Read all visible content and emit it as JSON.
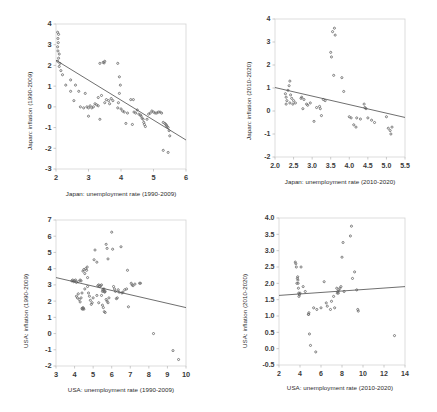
{
  "figure": {
    "type": "scatter-grid",
    "panel_count": 4,
    "marker_color": "#6b6b6b",
    "trendline_color": "#4a4a4a",
    "axis_color": "#d0d0d0",
    "background": "#ffffff"
  },
  "chart_data": [
    {
      "id": "japan-1990-2009",
      "type": "scatter",
      "title": "",
      "xlabel": "Japan: unemployment rate (1990-2009)",
      "ylabel": "Japan: inflation (1990-2009)",
      "xlim": [
        2,
        6
      ],
      "ylim": [
        -3,
        4
      ],
      "xticks": [
        "2",
        "3",
        "4",
        "5",
        "6"
      ],
      "yticks": [
        "-3",
        "-2",
        "-1",
        "0",
        "1",
        "2",
        "3",
        "4"
      ],
      "grid": false,
      "legend": "none",
      "trendline": {
        "x0": 2.0,
        "y0": 2.25,
        "x1": 6.0,
        "y1": -1.6
      },
      "points": [
        [
          2.05,
          3.6
        ],
        [
          2.08,
          3.5
        ],
        [
          2.06,
          3.3
        ],
        [
          2.07,
          3.1
        ],
        [
          2.05,
          2.9
        ],
        [
          2.06,
          2.7
        ],
        [
          2.1,
          2.55
        ],
        [
          2.08,
          2.35
        ],
        [
          2.05,
          2.2
        ],
        [
          2.12,
          2.1
        ],
        [
          2.1,
          1.95
        ],
        [
          2.15,
          1.75
        ],
        [
          2.2,
          1.55
        ],
        [
          2.3,
          1.05
        ],
        [
          2.45,
          1.3
        ],
        [
          2.6,
          1.05
        ],
        [
          2.45,
          0.75
        ],
        [
          2.7,
          0.75
        ],
        [
          2.9,
          0.65
        ],
        [
          2.55,
          0.3
        ],
        [
          2.95,
          0.0
        ],
        [
          3.0,
          -0.05
        ],
        [
          3.05,
          0.05
        ],
        [
          3.1,
          -0.05
        ],
        [
          3.15,
          0.0
        ],
        [
          3.2,
          0.15
        ],
        [
          3.25,
          0.1
        ],
        [
          3.3,
          0.05
        ],
        [
          3.35,
          2.1
        ],
        [
          3.45,
          2.15
        ],
        [
          3.5,
          2.2
        ],
        [
          3.48,
          2.12
        ],
        [
          3.3,
          0.45
        ],
        [
          3.35,
          -0.6
        ],
        [
          3.4,
          0.55
        ],
        [
          3.5,
          0.2
        ],
        [
          3.55,
          0.35
        ],
        [
          3.62,
          0.3
        ],
        [
          3.65,
          0.15
        ],
        [
          3.7,
          0.4
        ],
        [
          3.75,
          0.3
        ],
        [
          3.9,
          2.1
        ],
        [
          3.95,
          1.45
        ],
        [
          3.98,
          1.05
        ],
        [
          3.95,
          0.65
        ],
        [
          3.92,
          0.2
        ],
        [
          4.0,
          -0.1
        ],
        [
          4.05,
          -0.2
        ],
        [
          4.1,
          -0.25
        ],
        [
          4.2,
          -0.3
        ],
        [
          4.3,
          0.35
        ],
        [
          4.38,
          0.35
        ],
        [
          4.4,
          -0.25
        ],
        [
          4.45,
          -0.3
        ],
        [
          4.5,
          -0.15
        ],
        [
          4.55,
          -0.35
        ],
        [
          4.6,
          -0.4
        ],
        [
          4.62,
          -0.45
        ],
        [
          4.65,
          -0.55
        ],
        [
          4.68,
          -0.6
        ],
        [
          4.7,
          -0.75
        ],
        [
          4.72,
          -0.85
        ],
        [
          4.75,
          -0.95
        ],
        [
          4.8,
          -0.6
        ],
        [
          4.85,
          -0.35
        ],
        [
          4.9,
          -0.3
        ],
        [
          4.95,
          -0.2
        ],
        [
          5.0,
          -0.25
        ],
        [
          5.05,
          -0.3
        ],
        [
          5.1,
          -0.3
        ],
        [
          5.15,
          -0.25
        ],
        [
          5.2,
          -0.25
        ],
        [
          5.25,
          -0.3
        ],
        [
          5.3,
          -0.75
        ],
        [
          5.35,
          -0.8
        ],
        [
          5.38,
          -0.85
        ],
        [
          5.4,
          -0.9
        ],
        [
          5.42,
          -0.95
        ],
        [
          5.45,
          -1.0
        ],
        [
          5.48,
          -1.15
        ],
        [
          5.3,
          -2.1
        ],
        [
          5.45,
          -2.2
        ],
        [
          5.5,
          -1.4
        ],
        [
          4.35,
          -0.85
        ],
        [
          4.15,
          -0.8
        ],
        [
          3.9,
          -0.05
        ],
        [
          2.75,
          0.0
        ],
        [
          2.85,
          -0.05
        ],
        [
          3.0,
          -0.45
        ]
      ]
    },
    {
      "id": "japan-2010-2020",
      "type": "scatter",
      "title": "",
      "xlabel": "Japan: unemployment rate (2010-2020)",
      "ylabel": "Japan: inflation (2010-2020)",
      "xlim": [
        2.0,
        5.5
      ],
      "ylim": [
        -2,
        4
      ],
      "xticks": [
        "2.0",
        "2.5",
        "3.0",
        "3.5",
        "4.0",
        "4.5",
        "5.0",
        "5.5"
      ],
      "yticks": [
        "-2",
        "-1",
        "0",
        "1",
        "2",
        "3",
        "4"
      ],
      "grid": false,
      "legend": "none",
      "trendline": {
        "x0": 2.0,
        "y0": 1.02,
        "x1": 5.5,
        "y1": -0.28
      },
      "points": [
        [
          2.28,
          0.75
        ],
        [
          2.3,
          0.6
        ],
        [
          2.32,
          0.45
        ],
        [
          2.3,
          0.3
        ],
        [
          2.35,
          0.9
        ],
        [
          2.38,
          1.1
        ],
        [
          2.4,
          1.3
        ],
        [
          2.42,
          0.7
        ],
        [
          2.45,
          0.55
        ],
        [
          2.4,
          0.35
        ],
        [
          2.48,
          0.3
        ],
        [
          2.5,
          0.45
        ],
        [
          2.55,
          0.35
        ],
        [
          2.7,
          0.55
        ],
        [
          2.72,
          0.6
        ],
        [
          2.78,
          0.5
        ],
        [
          2.75,
          0.1
        ],
        [
          2.85,
          0.3
        ],
        [
          2.88,
          0.25
        ],
        [
          2.95,
          0.35
        ],
        [
          3.05,
          -0.45
        ],
        [
          3.12,
          0.15
        ],
        [
          3.2,
          0.2
        ],
        [
          3.22,
          0.1
        ],
        [
          3.25,
          -0.2
        ],
        [
          3.3,
          0.5
        ],
        [
          3.35,
          0.45
        ],
        [
          3.5,
          2.55
        ],
        [
          3.52,
          2.35
        ],
        [
          3.55,
          3.45
        ],
        [
          3.6,
          3.6
        ],
        [
          3.62,
          3.3
        ],
        [
          3.58,
          1.55
        ],
        [
          3.8,
          1.45
        ],
        [
          3.85,
          0.85
        ],
        [
          4.0,
          -0.25
        ],
        [
          4.05,
          -0.3
        ],
        [
          4.12,
          -0.6
        ],
        [
          4.18,
          -0.7
        ],
        [
          4.2,
          -0.3
        ],
        [
          4.3,
          -0.35
        ],
        [
          4.4,
          0.3
        ],
        [
          4.42,
          0.15
        ],
        [
          4.45,
          0.1
        ],
        [
          4.5,
          -0.3
        ],
        [
          4.6,
          -0.4
        ],
        [
          4.68,
          -0.5
        ],
        [
          5.0,
          -0.25
        ],
        [
          5.05,
          -0.75
        ],
        [
          5.1,
          -0.85
        ],
        [
          5.12,
          -1.0
        ],
        [
          5.15,
          -0.7
        ]
      ]
    },
    {
      "id": "usa-1990-2009",
      "type": "scatter",
      "title": "",
      "xlabel": "USA: unemployment rate (1990-2009)",
      "ylabel": "USA: inflation (1990-2009)",
      "xlim": [
        3,
        10
      ],
      "ylim": [
        -2,
        7
      ],
      "xticks": [
        "3",
        "4",
        "5",
        "6",
        "7",
        "8",
        "9",
        "10"
      ],
      "yticks": [
        "-2",
        "-1",
        "0",
        "1",
        "2",
        "3",
        "4",
        "5",
        "6",
        "7"
      ],
      "grid": false,
      "legend": "none",
      "trendline": {
        "x0": 3.0,
        "y0": 3.45,
        "x1": 10.0,
        "y1": 1.6
      },
      "points": [
        [
          3.85,
          3.25
        ],
        [
          3.9,
          3.3
        ],
        [
          3.95,
          3.2
        ],
        [
          4.0,
          3.25
        ],
        [
          4.05,
          3.3
        ],
        [
          4.1,
          3.15
        ],
        [
          4.2,
          3.2
        ],
        [
          4.3,
          3.3
        ],
        [
          4.35,
          3.25
        ],
        [
          4.1,
          2.3
        ],
        [
          4.15,
          2.2
        ],
        [
          4.2,
          2.45
        ],
        [
          4.25,
          2.1
        ],
        [
          4.3,
          1.95
        ],
        [
          4.35,
          2.2
        ],
        [
          4.4,
          1.55
        ],
        [
          4.42,
          1.5
        ],
        [
          4.45,
          1.6
        ],
        [
          4.48,
          1.55
        ],
        [
          4.5,
          1.5
        ],
        [
          4.4,
          2.5
        ],
        [
          4.45,
          3.85
        ],
        [
          4.5,
          3.95
        ],
        [
          4.55,
          3.7
        ],
        [
          4.6,
          4.0
        ],
        [
          4.65,
          3.9
        ],
        [
          4.68,
          4.1
        ],
        [
          4.7,
          3.45
        ],
        [
          4.75,
          2.5
        ],
        [
          4.8,
          2.3
        ],
        [
          4.85,
          2.05
        ],
        [
          4.9,
          1.8
        ],
        [
          4.95,
          1.9
        ],
        [
          5.0,
          2.2
        ],
        [
          5.05,
          4.55
        ],
        [
          5.1,
          5.15
        ],
        [
          5.2,
          4.4
        ],
        [
          5.25,
          2.95
        ],
        [
          5.3,
          3.0
        ],
        [
          5.35,
          2.9
        ],
        [
          5.4,
          2.95
        ],
        [
          5.45,
          3.0
        ],
        [
          5.5,
          2.6
        ],
        [
          5.52,
          2.7
        ],
        [
          5.55,
          2.65
        ],
        [
          5.58,
          2.75
        ],
        [
          5.6,
          2.6
        ],
        [
          5.62,
          2.55
        ],
        [
          5.65,
          2.6
        ],
        [
          5.7,
          5.5
        ],
        [
          5.75,
          5.25
        ],
        [
          5.8,
          4.6
        ],
        [
          5.5,
          1.75
        ],
        [
          5.55,
          1.6
        ],
        [
          5.6,
          1.35
        ],
        [
          5.65,
          1.3
        ],
        [
          5.7,
          2.1
        ],
        [
          5.75,
          2.0
        ],
        [
          5.8,
          1.9
        ],
        [
          5.85,
          2.2
        ],
        [
          6.0,
          6.25
        ],
        [
          6.05,
          5.2
        ],
        [
          6.1,
          2.9
        ],
        [
          6.15,
          2.75
        ],
        [
          6.2,
          2.6
        ],
        [
          6.25,
          2.15
        ],
        [
          6.3,
          2.2
        ],
        [
          6.35,
          2.7
        ],
        [
          6.4,
          2.55
        ],
        [
          6.5,
          5.35
        ],
        [
          6.55,
          2.5
        ],
        [
          6.6,
          2.55
        ],
        [
          6.7,
          2.7
        ],
        [
          6.8,
          2.75
        ],
        [
          6.85,
          3.9
        ],
        [
          6.9,
          1.65
        ],
        [
          7.05,
          3.1
        ],
        [
          7.1,
          3.0
        ],
        [
          7.15,
          2.95
        ],
        [
          7.25,
          3.05
        ],
        [
          7.5,
          3.1
        ],
        [
          7.55,
          3.1
        ],
        [
          8.25,
          0.0
        ],
        [
          9.3,
          -1.05
        ],
        [
          9.6,
          -1.6
        ],
        [
          4.55,
          2.75
        ],
        [
          4.7,
          2.9
        ],
        [
          5.2,
          2.35
        ],
        [
          5.3,
          1.9
        ],
        [
          5.45,
          2.35
        ]
      ]
    },
    {
      "id": "usa-2010-2020",
      "type": "scatter",
      "title": "",
      "xlabel": "USA: unemployment rate (2010-2020)",
      "ylabel": "USA: inflation (2010-2020)",
      "xlim": [
        2,
        14
      ],
      "ylim": [
        -0.5,
        4.0
      ],
      "xticks": [
        "2",
        "4",
        "6",
        "8",
        "10",
        "12",
        "14"
      ],
      "yticks": [
        "-0.5",
        "0.0",
        "0.5",
        "1.0",
        "1.5",
        "2.0",
        "2.5",
        "3.0",
        "3.5",
        "4.0"
      ],
      "grid": false,
      "legend": "none",
      "trendline": {
        "x0": 2.0,
        "y0": 1.63,
        "x1": 14.0,
        "y1": 1.9
      },
      "points": [
        [
          3.55,
          2.65
        ],
        [
          3.6,
          2.6
        ],
        [
          3.65,
          2.5
        ],
        [
          3.7,
          2.0
        ],
        [
          3.75,
          2.15
        ],
        [
          3.78,
          2.2
        ],
        [
          3.8,
          2.1
        ],
        [
          3.82,
          2.0
        ],
        [
          3.85,
          1.85
        ],
        [
          3.88,
          1.7
        ],
        [
          3.9,
          1.6
        ],
        [
          3.95,
          1.65
        ],
        [
          4.0,
          1.7
        ],
        [
          4.1,
          2.5
        ],
        [
          4.3,
          1.9
        ],
        [
          4.5,
          1.75
        ],
        [
          4.8,
          1.05
        ],
        [
          4.82,
          1.05
        ],
        [
          4.85,
          1.1
        ],
        [
          4.9,
          0.45
        ],
        [
          5.0,
          0.1
        ],
        [
          5.3,
          1.25
        ],
        [
          5.5,
          -0.1
        ],
        [
          5.6,
          1.2
        ],
        [
          6.0,
          1.25
        ],
        [
          6.3,
          2.05
        ],
        [
          6.5,
          1.4
        ],
        [
          6.6,
          1.3
        ],
        [
          6.9,
          1.2
        ],
        [
          7.0,
          1.45
        ],
        [
          7.2,
          1.6
        ],
        [
          7.3,
          1.25
        ],
        [
          7.5,
          1.85
        ],
        [
          7.55,
          1.7
        ],
        [
          7.6,
          1.75
        ],
        [
          7.65,
          1.7
        ],
        [
          7.7,
          1.8
        ],
        [
          7.8,
          1.85
        ],
        [
          7.9,
          1.9
        ],
        [
          8.0,
          2.8
        ],
        [
          8.1,
          3.25
        ],
        [
          8.2,
          1.75
        ],
        [
          8.8,
          3.45
        ],
        [
          8.9,
          3.75
        ],
        [
          9.0,
          2.15
        ],
        [
          9.2,
          2.35
        ],
        [
          9.4,
          1.8
        ],
        [
          9.5,
          1.2
        ],
        [
          9.55,
          1.15
        ],
        [
          13.0,
          0.4
        ]
      ]
    }
  ]
}
